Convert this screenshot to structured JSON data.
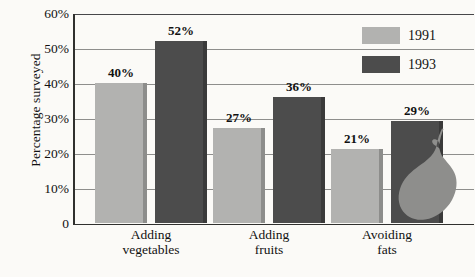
{
  "chart_data": {
    "type": "bar",
    "title": "",
    "subtitle": "",
    "xlabel": "",
    "ylabel": "Percentage surveyed",
    "categories": [
      "Adding vegetables",
      "Adding fruits",
      "Avoiding fats"
    ],
    "category_lines": [
      [
        "Adding",
        "vegetables"
      ],
      [
        "Adding",
        "fruits"
      ],
      [
        "Avoiding",
        "fats"
      ]
    ],
    "series": [
      {
        "name": "1991",
        "color": "#b2b2b0",
        "values": [
          40,
          27,
          21
        ],
        "labels": [
          "40%",
          "27%",
          "21%"
        ]
      },
      {
        "name": "1993",
        "color": "#4c4c4c",
        "values": [
          52,
          36,
          29
        ],
        "labels": [
          "52%",
          "36%",
          "29%"
        ]
      }
    ],
    "ylim": [
      0,
      60
    ],
    "yticks": [
      0,
      10,
      20,
      30,
      40,
      50,
      60
    ],
    "ytick_labels": [
      "0",
      "10%",
      "20%",
      "30%",
      "40%",
      "50%",
      "60%"
    ],
    "grid": true,
    "grid_axis": "y",
    "legend_position": "top-right",
    "legend_entries": [
      "1991",
      "1993"
    ]
  },
  "decoration": {
    "pear_label": "pear-illustration"
  },
  "colors": {
    "series_1991": "#b2b2b0",
    "series_1993": "#4c4c4c",
    "gridline": "#8e8e8c",
    "axis": "#30302e",
    "background": "#fbfaf7",
    "text": "#111111"
  }
}
